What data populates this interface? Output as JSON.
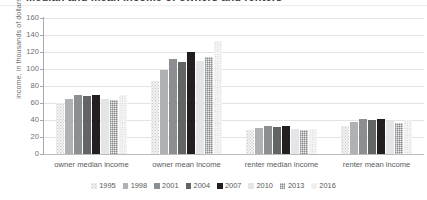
{
  "figure": {
    "title_clipped": "Median and mean income of owners and renters",
    "title_visible": false
  },
  "axes": {
    "ylabel": "income, in thousands of dollars",
    "yticks": [
      0,
      20,
      40,
      60,
      80,
      100,
      120,
      140,
      160
    ],
    "ymin": 0,
    "ymax": 160,
    "xlabel": ""
  },
  "legend": {
    "position": "bottom",
    "items": [
      {
        "label": "1995",
        "swatch": "s1995",
        "color": "#f2f2f2"
      },
      {
        "label": "1998",
        "swatch": "s1998",
        "color": "#b0b1b3"
      },
      {
        "label": "2001",
        "swatch": "s2001",
        "color": "#8d8e91"
      },
      {
        "label": "2004",
        "swatch": "s2004",
        "color": "#636466"
      },
      {
        "label": "2007",
        "swatch": "s2007",
        "color": "#231f20"
      },
      {
        "label": "2010",
        "swatch": "s2010",
        "color": "#e4e5e6"
      },
      {
        "label": "2013",
        "swatch": "s2013",
        "color": "#c4c5c7"
      },
      {
        "label": "2016",
        "swatch": "s2016",
        "color": "#cfcfd1"
      }
    ]
  },
  "chart_data": {
    "type": "bar",
    "title": "Median and mean income of owners and renters",
    "xlabel": "",
    "ylabel": "income, in thousands of dollars",
    "ylim": [
      0,
      160
    ],
    "ytick_step": 20,
    "grid": true,
    "legend_position": "bottom",
    "categories": [
      "owner median income",
      "owner mean income",
      "renter median income",
      "renter mean income"
    ],
    "series": [
      {
        "name": "1995",
        "values": [
          60,
          86,
          28,
          33
        ]
      },
      {
        "name": "1998",
        "values": [
          65,
          99,
          31,
          38
        ]
      },
      {
        "name": "2001",
        "values": [
          69,
          112,
          33,
          41
        ]
      },
      {
        "name": "2004",
        "values": [
          68,
          108,
          32,
          40
        ]
      },
      {
        "name": "2007",
        "values": [
          70,
          120,
          33,
          41
        ]
      },
      {
        "name": "2010",
        "values": [
          65,
          110,
          30,
          39
        ]
      },
      {
        "name": "2013",
        "values": [
          64,
          114,
          28,
          37
        ]
      },
      {
        "name": "2016",
        "values": [
          69,
          133,
          30,
          40
        ]
      }
    ]
  }
}
